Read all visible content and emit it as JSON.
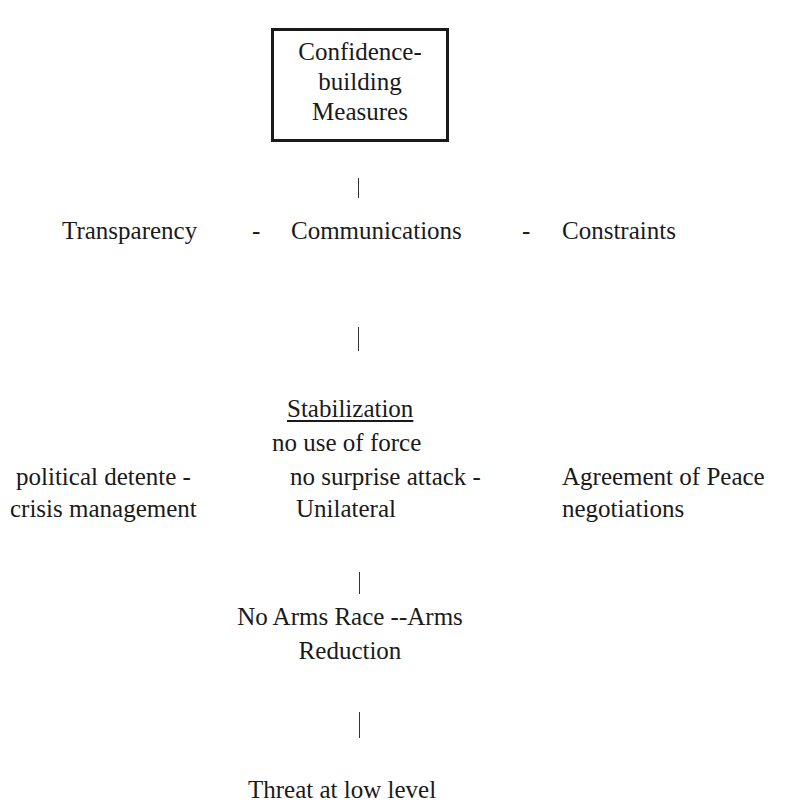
{
  "diagram": {
    "root": {
      "lines": [
        "Confidence-",
        "building",
        "Measures"
      ]
    },
    "level1": {
      "items": [
        "Transparency",
        "Communications",
        "Constraints"
      ],
      "separator": "-"
    },
    "level2": {
      "heading": "Stabilization",
      "center_line1": "no use of force",
      "row_left_1": "political detente  -",
      "row_left_2": "crisis management",
      "row_center_1": "no surprise attack  -",
      "row_center_2": "Unilateral",
      "row_right_1": "Agreement of Peace",
      "row_right_2": "negotiations"
    },
    "level3": {
      "lines": [
        "No Arms Race --Arms",
        "Reduction"
      ]
    },
    "level4": {
      "partial_text": "Threat at low level"
    },
    "connector_glyph": "|"
  }
}
